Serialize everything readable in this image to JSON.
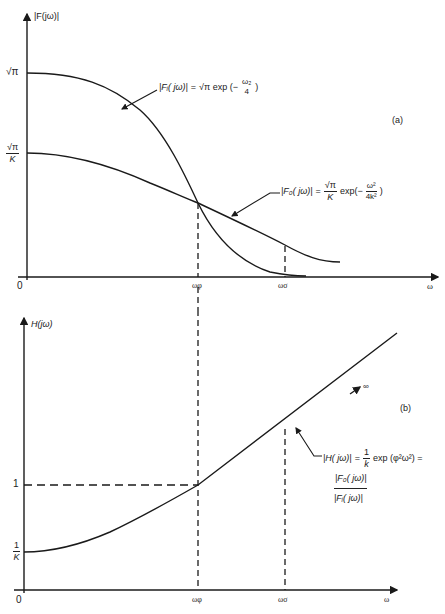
{
  "figure": {
    "panel_a": {
      "panel_label": "(a)",
      "y_axis_label": "|F(jω)|",
      "x_axis_label": "ω",
      "origin_label": "0",
      "y_ticks": {
        "sqrt_pi": "√π",
        "sqrt_pi_over_k_num": "√π",
        "sqrt_pi_over_k_den": "K"
      },
      "x_ticks": {
        "omega_phi": "ωφ",
        "omega_sigma": "ωσ"
      },
      "curve_fi": {
        "name": "|Fᵢ(jω)|",
        "lhs": "|Fᵢ( jω)|",
        "eq": "=",
        "rhs_prefix": "√π exp (−",
        "frac_num": "ω₂",
        "frac_den": "4",
        "rhs_suffix": ")"
      },
      "curve_fo": {
        "name": "|F₀(jω)|",
        "lhs": "|F₀( jω)|",
        "eq": "=",
        "coef_num": "√π",
        "coef_den": "K",
        "rhs_mid": "exp(−",
        "frac_num": "ω²",
        "frac_den": "4k²",
        "rhs_suffix": ")"
      }
    },
    "panel_b": {
      "panel_label": "(b)",
      "y_axis_label": "H(jω)",
      "x_axis_label": "ω",
      "origin_label": "0",
      "y_ticks": {
        "one": "1",
        "one_over_k_num": "1",
        "one_over_k_den": "K"
      },
      "x_ticks": {
        "omega_phi": "ωφ",
        "omega_sigma": "ωσ"
      },
      "infinity_label": "∞",
      "curve_h": {
        "lhs": "|H( jω)|",
        "eq": "=",
        "coef_num": "1",
        "coef_den": "k",
        "rhs_mid": "exp (φ²ω²) =",
        "ratio_num": "|F₀( jω)|",
        "ratio_den": "|Fᵢ( jω)|"
      }
    },
    "colors": {
      "line": "#1a1a1a",
      "background": "#ffffff"
    }
  }
}
